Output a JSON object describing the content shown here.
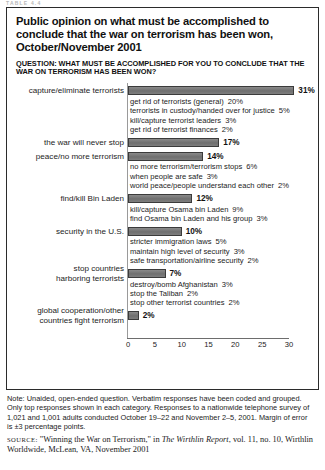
{
  "running_head": "TABLE 4.4",
  "figure": {
    "title": "Public opinion on what must be accomplished to conclude that the war on terrorism has been won, October/November 2001",
    "question": "QUESTION: WHAT MUST BE ACCOMPLISHED FOR YOU TO CONCLUDE THAT THE WAR ON TERRORISM HAS BEEN WON?"
  },
  "note": {
    "label": "Note:",
    "text": "Unaided, open-ended question. Verbatim responses have been coded and grouped. Only top responses shown in each category. Responses to a nationwide telephone survey of 1,021 and 1,001 adults conducted October 19–22 and November 2–5, 2001. Margin of error is ±3 percentage points."
  },
  "source": {
    "label": "SOURCE:",
    "title": "\"Winning the War on Terrorism,\"",
    "connector": " in ",
    "publication": "The Wirthlin Report",
    "rest": ", vol. 11, no. 10, Wirthlin Worldwide, McLean, VA, November 2001"
  },
  "chart_data": {
    "type": "bar",
    "orientation": "horizontal",
    "title": "Public opinion on what must be accomplished to conclude that the war on terrorism has been won, October/November 2001",
    "xlabel": "",
    "ylabel": "",
    "xlim": [
      0,
      30
    ],
    "xticks": [
      "0",
      "5",
      "10",
      "15",
      "20",
      "25",
      "30"
    ],
    "grid": false,
    "legend": false,
    "value_suffix": "%",
    "categories": [
      "capture/eliminate terrorists",
      "the war will never stop",
      "peace/no more terrorism",
      "find/kill Bin Laden",
      "security in the U.S.",
      "stop countries\nharboring terrorists",
      "global cooperation/other\ncountries fight terrorism"
    ],
    "values": [
      31,
      17,
      14,
      12,
      10,
      7,
      2
    ],
    "value_labels": [
      "31%",
      "17%",
      "14%",
      "12%",
      "10%",
      "7%",
      "2%"
    ],
    "subitems": [
      [
        {
          "label": "get rid of terrorists (general)",
          "value": "20%"
        },
        {
          "label": "terrorists in custody/handed over for justice",
          "value": "5%"
        },
        {
          "label": "kill/capture terrorist leaders",
          "value": "3%"
        },
        {
          "label": "get rid of terrorist finances",
          "value": "2%"
        }
      ],
      [],
      [
        {
          "label": "no more terrorism/terrorism stops",
          "value": "6%"
        },
        {
          "label": "when people are safe",
          "value": "3%"
        },
        {
          "label": "world peace/people understand each other",
          "value": "2%"
        }
      ],
      [
        {
          "label": "kill/capture Osama bin Laden",
          "value": "9%"
        },
        {
          "label": "find Osama bin Laden and his group",
          "value": "3%"
        }
      ],
      [
        {
          "label": "stricter immigration laws",
          "value": "5%"
        },
        {
          "label": "maintain high level of security",
          "value": "3%"
        },
        {
          "label": "safe transportation/airline security",
          "value": "2%"
        }
      ],
      [
        {
          "label": "destroy/bomb Afghanistan",
          "value": "3%"
        },
        {
          "label": "stop the Taliban",
          "value": "2%"
        },
        {
          "label": "stop other terrorist countries",
          "value": "2%"
        }
      ],
      []
    ],
    "colors": {
      "bar_fill": "#7b7b7b",
      "bar_stroke": "#3b3b3b",
      "axis": "#6d6d6d",
      "text": "#1c1c1c"
    }
  }
}
